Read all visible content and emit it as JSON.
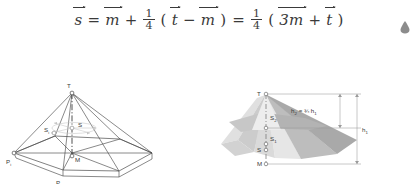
{
  "equation": {
    "lhs": "s",
    "terms": {
      "m": "m",
      "t": "t",
      "three_m": "3m",
      "numerator": "1",
      "denominator": "4",
      "plus": "+",
      "minus": "−",
      "equals": "=",
      "lparen": "(",
      "rparen": ")"
    },
    "plain_text": "s⃗ = m⃗ + 1/4(t⃗ − m⃗) = 1/4(3m⃗ + t⃗)"
  },
  "left_figure": {
    "caption": "wireframe hexagonal pyramid",
    "labels": {
      "apex": "T",
      "apex_sub": "",
      "centroid_partial": "S",
      "centroid_partial_sub": "i",
      "centroid": "S",
      "base_center": "M",
      "vertex_left": "P",
      "vertex_left_sub": "i",
      "vertex_front": "P",
      "vertex_front_sub": "i+1"
    }
  },
  "right_figure": {
    "caption": "shaded pyramid with height dimensions",
    "labels": {
      "apex": "T",
      "s2": "S",
      "s2_sub": "2",
      "s1": "S",
      "s1_sub": "1",
      "s": "S",
      "base_center": "M",
      "dim_upper": "h",
      "dim_upper_sub": "2",
      "dim_upper_rel": "= ¾ h",
      "dim_upper_rel_sub": "1",
      "dim_total": "h",
      "dim_total_sub": "1"
    }
  },
  "corner_mark": {
    "icon": "droplet-icon",
    "color": "#8c8c8c"
  },
  "colors": {
    "background": "#ffffff",
    "ink": "#3a3a3a",
    "line": "#4a4a4a",
    "faint": "#c9c9c9",
    "shade_light": "#d8d8d8",
    "shade_mid": "#bdbdbd",
    "shade_dark": "#9e9e9e",
    "shade_darker": "#8a8a8a"
  }
}
